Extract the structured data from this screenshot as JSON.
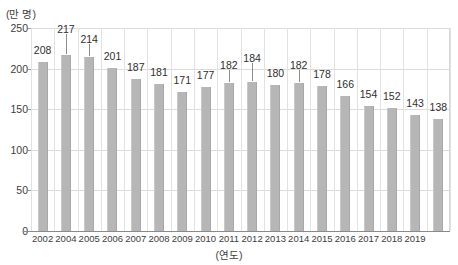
{
  "chart_data": {
    "type": "bar",
    "title": "",
    "subtitle": "",
    "xlabel": "(연도)",
    "ylabel": "(만 명)",
    "ylim": [
      0,
      250
    ],
    "yticks": [
      0,
      50,
      100,
      150,
      200,
      250
    ],
    "grid": true,
    "legend": null,
    "legend_position": "none",
    "categories": [
      "2002",
      "2004",
      "2005",
      "2006",
      "2007",
      "2008",
      "2009",
      "2010",
      "2011",
      "2012",
      "2013",
      "2014",
      "2015",
      "2016",
      "2017",
      "2018",
      "2019",
      ""
    ],
    "x": [
      "2002",
      "2004",
      "2005",
      "2006",
      "2007",
      "2008",
      "2009",
      "2010",
      "2011",
      "2012",
      "2013",
      "2014",
      "2015",
      "2016",
      "2017",
      "2018",
      "2019",
      ""
    ],
    "values": [
      208,
      217,
      214,
      201,
      187,
      181,
      171,
      177,
      182,
      184,
      180,
      182,
      178,
      166,
      154,
      152,
      143,
      138
    ],
    "data_labels": [
      "208",
      "217",
      "214",
      "201",
      "187",
      "181",
      "171",
      "177",
      "182",
      "184",
      "180",
      "182",
      "178",
      "166",
      "154",
      "152",
      "143",
      "138"
    ],
    "bar_color": "#b6b6b6",
    "grid_color": "#dcdcdc",
    "axis_color": "#8a8a8a",
    "text_color": "#3a3a3a"
  },
  "axes": {
    "y_unit_label": "(만 명)",
    "x_unit_label": "(연도)",
    "y_tick_labels": [
      "250",
      "200",
      "150",
      "100",
      "50",
      "0"
    ],
    "x_tick_labels": [
      "2002",
      "2004",
      "2005",
      "2006",
      "2007",
      "2008",
      "2009",
      "2010",
      "2011",
      "2012",
      "2013",
      "2014",
      "2015",
      "2016",
      "2017",
      "2018",
      "2019"
    ]
  }
}
